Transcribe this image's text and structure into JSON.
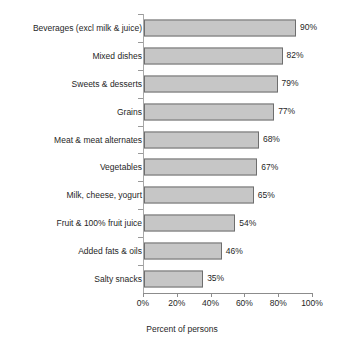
{
  "chart_data": {
    "type": "bar",
    "orientation": "horizontal",
    "title": "",
    "xlabel": "Percent of persons",
    "ylabel": "",
    "xlim": [
      0,
      100
    ],
    "xticks": [
      "0%",
      "20%",
      "40%",
      "60%",
      "80%",
      "100%"
    ],
    "xtick_values": [
      0,
      20,
      40,
      60,
      80,
      100
    ],
    "grid": false,
    "legend": null,
    "categories": [
      "Beverages (excl milk & juice)",
      "Mixed dishes",
      "Sweets & desserts",
      "Grains",
      "Meat & meat alternates",
      "Vegetables",
      "Milk, cheese, yogurt",
      "Fruit & 100% fruit juice",
      "Added fats & oils",
      "Salty snacks"
    ],
    "values": [
      90,
      82,
      79,
      77,
      68,
      67,
      65,
      54,
      46,
      35
    ],
    "value_labels": [
      "90%",
      "82%",
      "79%",
      "77%",
      "68%",
      "67%",
      "65%",
      "54%",
      "46%",
      "35%"
    ],
    "colors": {
      "bar_fill": "#c6c6c6",
      "bar_border": "#6e6e6e",
      "axis": "#8c8c8c",
      "text": "#1f1f1f",
      "background": "#ffffff"
    }
  }
}
